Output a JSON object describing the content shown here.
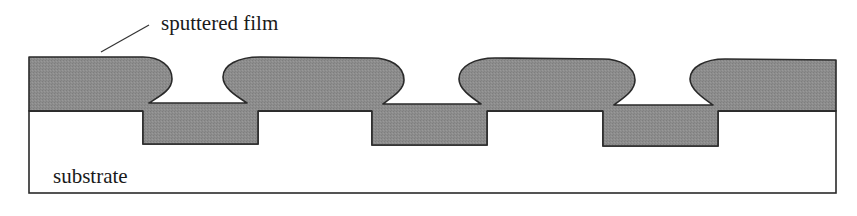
{
  "diagram": {
    "labels": {
      "film": "sputtered film",
      "substrate": "substrate"
    },
    "colors": {
      "film_fill": "#8c8c8c",
      "outline": "#2a2a2a",
      "substrate_fill": "#ffffff"
    },
    "trench_count": 3
  }
}
